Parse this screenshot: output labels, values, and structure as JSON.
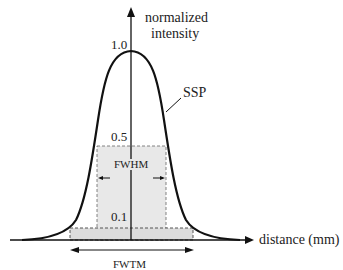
{
  "diagram": {
    "y_axis_label_line1": "normalized",
    "y_axis_label_line2": "intensity",
    "x_axis_label": "distance (mm)",
    "curve_label": "SSP",
    "tick_1_0": "1.0",
    "tick_0_5": "0.5",
    "tick_0_1": "0.1",
    "fwhm_label": "FWHM",
    "fwtm_label": "FWTM",
    "colors": {
      "line": "#111111",
      "shade": "#e6e6e6",
      "dash": "#555555"
    }
  }
}
